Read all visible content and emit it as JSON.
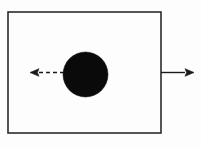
{
  "figure": {
    "title": "Filled circle inside a rectangle with two directional arrows",
    "type": "line-diagram",
    "canvas": {
      "width": 201,
      "height": 148
    },
    "background_color": "#fdfdfd",
    "ink_color": "#1a1a1a"
  },
  "shapes": {
    "box": {
      "label": "rectangle",
      "x": 8,
      "y": 12,
      "width": 153,
      "height": 121,
      "stroke_color": "#2b2b2b",
      "stroke_width": 1.6,
      "fill": "none"
    },
    "circle": {
      "label": "filled circle",
      "cx": 85.5,
      "cy": 74.5,
      "r": 22.5,
      "fill_color": "#0a0a0a",
      "stroke_color": "#0a0a0a"
    }
  },
  "arrows": [
    {
      "name": "left-arrow",
      "label": "dashed arrow pointing left",
      "direction": "left",
      "style": "dashed",
      "from_x": 64,
      "to_x": 30,
      "y": 72.5,
      "stroke_color": "#1a1a1a",
      "stroke_width": 1.4,
      "dash_pattern": "4 3"
    },
    {
      "name": "right-arrow",
      "label": "solid arrow pointing right",
      "direction": "right",
      "style": "solid",
      "from_x": 161,
      "to_x": 194,
      "y": 72.5,
      "stroke_color": "#1a1a1a",
      "stroke_width": 1.4,
      "dash_pattern": "none"
    }
  ]
}
